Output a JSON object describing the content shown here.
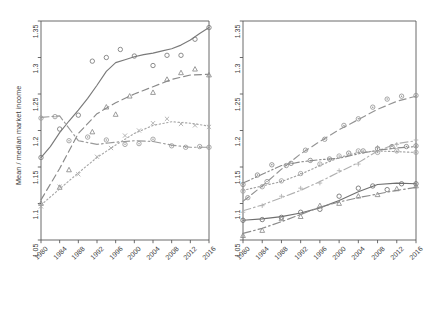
{
  "figure": {
    "width": 441,
    "height": 316,
    "background": "#ffffff",
    "axis_color": "#5a5a5a",
    "text_color": "#3d3d3d"
  },
  "chart_data": [
    {
      "type": "line",
      "panel": "left",
      "title": "",
      "xlabel": "",
      "ylabel": "Mean / median market income",
      "xlim": [
        1980,
        2016
      ],
      "ylim": [
        1.05,
        1.35
      ],
      "yticks": [
        "1.05",
        "1.1",
        "1.15",
        "1.2",
        "1.25",
        "1.3",
        "1.35"
      ],
      "ytick_values": [
        1.05,
        1.1,
        1.15,
        1.2,
        1.25,
        1.3,
        1.35
      ],
      "xticks": [
        "1980",
        "1984",
        "1988",
        "1992",
        "1996",
        "2000",
        "2004",
        "2008",
        "2012",
        "2016"
      ],
      "xtick_values": [
        1980,
        1984,
        1988,
        1992,
        1996,
        2000,
        2004,
        2008,
        2012,
        2016
      ],
      "grid": false,
      "legend_position": "bottom",
      "series": [
        {
          "name": "United States",
          "dash": "solid",
          "color": "#7a7a7a",
          "marker": "circle",
          "x": [
            1980,
            1982,
            1984,
            1986,
            1988,
            1990,
            1992,
            1994,
            1996,
            1998,
            2000,
            2002,
            2004,
            2006,
            2008,
            2010,
            2012,
            2014,
            2016
          ],
          "y": [
            1.163,
            1.178,
            1.197,
            1.213,
            1.228,
            1.244,
            1.262,
            1.281,
            1.293,
            1.297,
            1.301,
            1.304,
            1.306,
            1.309,
            1.312,
            1.317,
            1.324,
            1.333,
            1.341
          ],
          "points_x": [
            1980,
            1984,
            1988,
            1991,
            1994,
            1997,
            2000,
            2004,
            2007,
            2010,
            2013,
            2016
          ],
          "points_y": [
            1.163,
            1.202,
            1.221,
            1.295,
            1.3,
            1.311,
            1.302,
            1.289,
            1.303,
            1.303,
            1.325,
            1.341
          ]
        },
        {
          "name": "Great Britain",
          "dash": "dashed",
          "color": "#8a8a8a",
          "marker": "triangle",
          "x": [
            1980,
            1984,
            1988,
            1992,
            1996,
            2000,
            2004,
            2008,
            2012,
            2016
          ],
          "y": [
            1.105,
            1.148,
            1.196,
            1.223,
            1.238,
            1.25,
            1.26,
            1.27,
            1.276,
            1.277
          ],
          "points_x": [
            1980,
            1984,
            1986,
            1991,
            1994,
            1996,
            1999,
            2004,
            2007,
            2010,
            2013,
            2016
          ],
          "points_y": [
            1.1,
            1.122,
            1.146,
            1.198,
            1.232,
            1.222,
            1.247,
            1.252,
            1.27,
            1.279,
            1.284,
            1.276
          ]
        },
        {
          "name": "Germany",
          "dash": "dashdot",
          "color": "#9a9a9a",
          "marker": "circle-dot",
          "x": [
            1980,
            1984,
            1988,
            1992,
            1996,
            2000,
            2004,
            2008,
            2012,
            2016
          ],
          "y": [
            1.218,
            1.22,
            1.186,
            1.181,
            1.184,
            1.186,
            1.185,
            1.18,
            1.177,
            1.177
          ],
          "points_x": [
            1980,
            1983,
            1986,
            1990,
            1994,
            1998,
            2001,
            2004,
            2008,
            2011,
            2014,
            2016
          ],
          "points_y": [
            1.217,
            1.219,
            1.186,
            1.191,
            1.187,
            1.181,
            1.182,
            1.188,
            1.179,
            1.177,
            1.178,
            1.177
          ]
        },
        {
          "name": "France",
          "dash": "dotted",
          "color": "#a8a8a8",
          "marker": "cross",
          "x": [
            1980,
            1984,
            1988,
            1992,
            1996,
            2000,
            2004,
            2008,
            2012,
            2016
          ],
          "y": [
            1.098,
            1.12,
            1.142,
            1.163,
            1.18,
            1.196,
            1.207,
            1.212,
            1.21,
            1.206
          ],
          "points_x": [
            1980,
            1984,
            1988,
            1992,
            1995,
            1998,
            2001,
            2004,
            2007,
            2010,
            2013,
            2016
          ],
          "points_y": [
            1.096,
            1.123,
            1.14,
            1.164,
            1.176,
            1.193,
            1.2,
            1.21,
            1.216,
            1.209,
            1.207,
            1.205
          ]
        }
      ],
      "legend": [
        {
          "label": "United States",
          "dash": "solid"
        },
        {
          "label": "Great Britain",
          "dash": "dashed"
        },
        {
          "label": "Germany",
          "dash": "dashdot"
        },
        {
          "label": "France",
          "dash": "dotted"
        }
      ]
    },
    {
      "type": "line",
      "panel": "right",
      "title": "",
      "xlabel": "",
      "ylabel": "",
      "xlim": [
        1980,
        2016
      ],
      "ylim": [
        1.05,
        1.35
      ],
      "yticks": [
        "1.05",
        "1.1",
        "1.15",
        "1.2",
        "1.25",
        "1.3",
        "1.35"
      ],
      "ytick_values": [
        1.05,
        1.1,
        1.15,
        1.2,
        1.25,
        1.3,
        1.35
      ],
      "xticks": [
        "1980",
        "1984",
        "1988",
        "1992",
        "1996",
        "2000",
        "2004",
        "2008",
        "2012",
        "2016"
      ],
      "xtick_values": [
        1980,
        1984,
        1988,
        1992,
        1996,
        2000,
        2004,
        2008,
        2012,
        2016
      ],
      "grid": false,
      "legend_position": "bottom",
      "series": [
        {
          "name": "Norway",
          "dash": "solid",
          "color": "#6f6f6f",
          "marker": "circle",
          "x": [
            1980,
            1984,
            1988,
            1992,
            1996,
            2000,
            2004,
            2008,
            2012,
            2016
          ],
          "y": [
            1.077,
            1.079,
            1.082,
            1.087,
            1.094,
            1.104,
            1.116,
            1.126,
            1.128,
            1.127
          ],
          "points_x": [
            1980,
            1984,
            1988,
            1992,
            1996,
            2000,
            2004,
            2007,
            2010,
            2013,
            2016
          ],
          "points_y": [
            1.077,
            1.078,
            1.081,
            1.088,
            1.092,
            1.11,
            1.121,
            1.124,
            1.119,
            1.127,
            1.127
          ]
        },
        {
          "name": "Sweden",
          "dash": "dashdot",
          "color": "#8c8c8c",
          "marker": "triangle",
          "x": [
            1980,
            1984,
            1988,
            1992,
            1996,
            2000,
            2004,
            2008,
            2012,
            2016
          ],
          "y": [
            1.059,
            1.066,
            1.075,
            1.085,
            1.095,
            1.102,
            1.108,
            1.113,
            1.118,
            1.122
          ],
          "points_x": [
            1980,
            1984,
            1988,
            1992,
            1996,
            2000,
            2004,
            2008,
            2012,
            2016
          ],
          "points_y": [
            1.056,
            1.063,
            1.079,
            1.082,
            1.097,
            1.1,
            1.11,
            1.112,
            1.12,
            1.124
          ]
        },
        {
          "name": "Denmark",
          "dash": "dashdot",
          "color": "#b0b0b0",
          "marker": "plus",
          "x": [
            1980,
            1984,
            1988,
            1992,
            1996,
            2000,
            2004,
            2008,
            2012,
            2016
          ],
          "y": [
            1.09,
            1.098,
            1.108,
            1.118,
            1.13,
            1.143,
            1.156,
            1.172,
            1.182,
            1.186
          ],
          "points_x": [
            1980,
            1984,
            1988,
            1992,
            1996,
            2000,
            2004,
            2008,
            2012,
            2016
          ],
          "points_y": [
            1.088,
            1.097,
            1.11,
            1.121,
            1.128,
            1.145,
            1.154,
            1.177,
            1.181,
            1.187
          ]
        },
        {
          "name": "Netherlands",
          "dash": "dashdotdot",
          "color": "#8a8a8a",
          "marker": "circle-dot",
          "x": [
            1980,
            1984,
            1988,
            1992,
            1996,
            2000,
            2004,
            2008,
            2012,
            2016
          ],
          "y": [
            1.128,
            1.14,
            1.152,
            1.157,
            1.16,
            1.162,
            1.168,
            1.173,
            1.176,
            1.178
          ],
          "points_x": [
            1980,
            1983,
            1986,
            1990,
            1994,
            1998,
            2002,
            2005,
            2008,
            2011,
            2014,
            2016
          ],
          "points_y": [
            1.126,
            1.139,
            1.153,
            1.155,
            1.159,
            1.161,
            1.169,
            1.172,
            1.175,
            1.178,
            1.178,
            1.179
          ]
        },
        {
          "name": "Canada",
          "dash": "dotted",
          "color": "#a0a0a0",
          "marker": "circle-dot",
          "x": [
            1980,
            1984,
            1988,
            1992,
            1996,
            2000,
            2004,
            2008,
            2012,
            2016
          ],
          "y": [
            1.118,
            1.124,
            1.13,
            1.14,
            1.152,
            1.163,
            1.17,
            1.172,
            1.171,
            1.17
          ],
          "points_x": [
            1980,
            1984,
            1988,
            1992,
            1996,
            2000,
            2004,
            2008,
            2012,
            2016
          ],
          "points_y": [
            1.117,
            1.123,
            1.131,
            1.141,
            1.154,
            1.165,
            1.172,
            1.17,
            1.172,
            1.17
          ]
        },
        {
          "name": "Australia",
          "dash": "dashed",
          "color": "#949494",
          "marker": "circle-dot",
          "x": [
            1980,
            1984,
            1988,
            1992,
            1996,
            2000,
            2004,
            2008,
            2012,
            2016
          ],
          "y": [
            1.103,
            1.124,
            1.147,
            1.168,
            1.185,
            1.201,
            1.215,
            1.229,
            1.24,
            1.247
          ],
          "points_x": [
            1981,
            1985,
            1989,
            1993,
            1997,
            2001,
            2004,
            2007,
            2010,
            2013,
            2016
          ],
          "points_y": [
            1.108,
            1.13,
            1.152,
            1.173,
            1.188,
            1.207,
            1.216,
            1.232,
            1.243,
            1.247,
            1.248
          ]
        }
      ],
      "legend": [
        {
          "label": "Norway",
          "dash": "solid"
        },
        {
          "label": "Sweden",
          "dash": "dashdot"
        },
        {
          "label": "Denmark",
          "dash": "dashdot"
        },
        {
          "label": "Netherlands",
          "dash": "dashdotdot"
        },
        {
          "label": "Canada",
          "dash": "dotted"
        },
        {
          "label": "Australia",
          "dash": "dashed"
        }
      ]
    }
  ]
}
